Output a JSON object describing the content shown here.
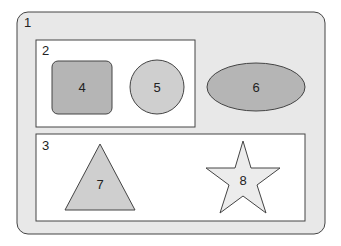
{
  "colors": {
    "outer_fill": "#e8e8e8",
    "box_fill": "#ffffff",
    "stroke": "#444444",
    "shape_dark": "#b5b5b5",
    "shape_mid": "#cfcfcf",
    "shape_light": "#e6e6e6"
  },
  "containers": [
    {
      "id": "1",
      "label": "1"
    },
    {
      "id": "2",
      "label": "2"
    },
    {
      "id": "3",
      "label": "3"
    }
  ],
  "shapes": [
    {
      "id": "4",
      "label": "4",
      "type": "rounded-rectangle"
    },
    {
      "id": "5",
      "label": "5",
      "type": "circle"
    },
    {
      "id": "6",
      "label": "6",
      "type": "ellipse"
    },
    {
      "id": "7",
      "label": "7",
      "type": "triangle"
    },
    {
      "id": "8",
      "label": "8",
      "type": "star"
    }
  ]
}
